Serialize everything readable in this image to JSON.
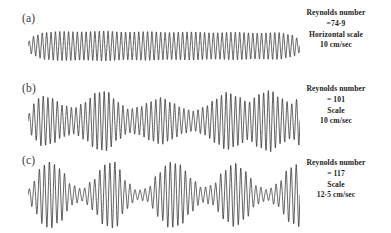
{
  "figure": {
    "background_color": "#ffffff",
    "trace_color": "#1a1a1a",
    "width": 391,
    "height": 233
  },
  "panels": [
    {
      "label": "(a)",
      "reynolds_caption": "Reynolds number",
      "reynolds_value": "=74·9",
      "scale_caption": "Horizontal scale",
      "scale_value": "10 cm/sec"
    },
    {
      "label": "(b)",
      "reynolds_caption": "Reynolds number",
      "reynolds_value": "= 101",
      "scale_caption": "Scale",
      "scale_value": "10 cm/sec"
    },
    {
      "label": "(c)",
      "reynolds_caption": "Reynolds number",
      "reynolds_value": "= 117",
      "scale_caption": "Scale",
      "scale_value": "12·5 cm/sec"
    }
  ],
  "chart_data": {
    "type": "line",
    "title": "",
    "xlabel": "",
    "ylabel": "",
    "series": [
      {
        "name": "(a) Reynolds number = 74.9",
        "reynolds_number": 74.9,
        "horizontal_scale": "10 cm/sec",
        "carrier_cycles": 62,
        "baseline_y": 0,
        "peak_amplitude": 1.0,
        "envelope_x": [
          0.0,
          0.02,
          0.06,
          0.12,
          0.2,
          0.28,
          0.36,
          0.44,
          0.52,
          0.6,
          0.68,
          0.76,
          0.84,
          0.92,
          0.97,
          1.0
        ],
        "envelope_y": [
          0.28,
          0.62,
          0.86,
          0.93,
          0.9,
          0.95,
          0.88,
          0.92,
          0.86,
          0.9,
          0.84,
          0.88,
          0.82,
          0.86,
          0.7,
          0.42
        ]
      },
      {
        "name": "(b) Reynolds number = 101",
        "reynolds_number": 101,
        "horizontal_scale": "10 cm/sec",
        "carrier_cycles": 58,
        "baseline_y": 0,
        "peak_amplitude": 1.0,
        "envelope_x": [
          0.0,
          0.02,
          0.05,
          0.09,
          0.13,
          0.17,
          0.21,
          0.25,
          0.29,
          0.33,
          0.37,
          0.41,
          0.45,
          0.49,
          0.53,
          0.57,
          0.61,
          0.65,
          0.69,
          0.73,
          0.77,
          0.81,
          0.85,
          0.89,
          0.93,
          0.97,
          1.0
        ],
        "envelope_y": [
          0.2,
          0.55,
          0.8,
          0.72,
          0.5,
          0.42,
          0.6,
          0.9,
          0.95,
          0.6,
          0.38,
          0.45,
          0.62,
          0.75,
          0.58,
          0.4,
          0.32,
          0.45,
          0.7,
          0.92,
          0.78,
          0.6,
          0.85,
          0.98,
          0.72,
          0.55,
          0.78
        ]
      },
      {
        "name": "(c) Reynolds number = 117",
        "reynolds_number": 117,
        "horizontal_scale": "12.5 cm/sec",
        "carrier_cycles": 54,
        "baseline_y": 0,
        "peak_amplitude": 1.0,
        "envelope_x": [
          0.0,
          0.02,
          0.05,
          0.08,
          0.12,
          0.16,
          0.2,
          0.24,
          0.28,
          0.32,
          0.36,
          0.4,
          0.44,
          0.48,
          0.52,
          0.56,
          0.6,
          0.64,
          0.68,
          0.72,
          0.76,
          0.8,
          0.84,
          0.88,
          0.92,
          0.96,
          1.0
        ],
        "envelope_y": [
          0.15,
          0.4,
          0.85,
          1.0,
          0.78,
          0.3,
          0.18,
          0.45,
          0.9,
          1.0,
          0.42,
          0.14,
          0.2,
          0.65,
          0.98,
          0.9,
          0.5,
          0.22,
          0.3,
          0.72,
          0.95,
          0.7,
          0.28,
          0.16,
          0.35,
          0.8,
          0.95
        ]
      }
    ]
  }
}
